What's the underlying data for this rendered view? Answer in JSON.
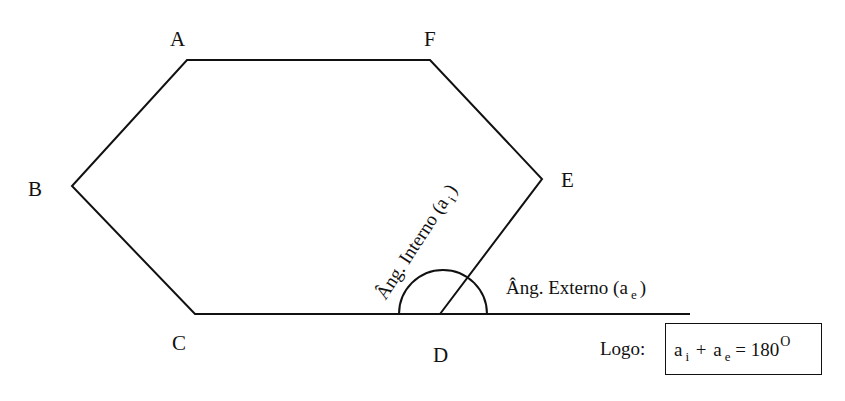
{
  "diagram": {
    "type": "hexagon-angle-illustration",
    "vertices": {
      "A": {
        "label": "A",
        "x": 187,
        "y": 60
      },
      "F": {
        "label": "F",
        "x": 430,
        "y": 60
      },
      "E": {
        "label": "E",
        "x": 542,
        "y": 179
      },
      "D": {
        "label": "D",
        "x": 440,
        "y": 314
      },
      "C": {
        "label": "C",
        "x": 195,
        "y": 314
      },
      "B": {
        "label": "B",
        "x": 72,
        "y": 186
      }
    },
    "extension_line_end": {
      "x": 690,
      "y": 314
    },
    "arc": {
      "cx": 443,
      "cy": 314,
      "r": 44
    },
    "stroke_color": "#111111"
  },
  "labels": {
    "A": "A",
    "B": "B",
    "C": "C",
    "D": "D",
    "E": "E",
    "F": "F"
  },
  "annotations": {
    "internal_angle": {
      "text": "Âng. Interno (a",
      "sub": "i",
      "close": ")"
    },
    "external_angle": {
      "text": "Âng. Externo (a",
      "sub": "e",
      "close": ")"
    }
  },
  "conclusion": {
    "prefix": "Logo:",
    "formula": {
      "term1": "a",
      "term1_sub": "i",
      "plus": "+",
      "term2": "a",
      "term2_sub": "e",
      "equals": "= 180",
      "degree": "O"
    }
  }
}
